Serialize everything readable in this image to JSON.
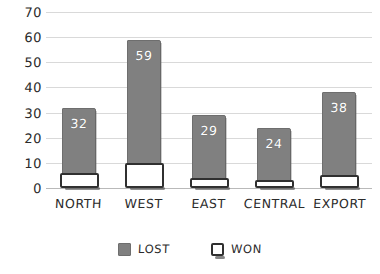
{
  "chart_data": {
    "type": "bar",
    "title": "",
    "subtitle": "",
    "xlabel": "",
    "ylabel": "",
    "categories": [
      "NORTH",
      "WEST",
      "EAST",
      "CENTRAL",
      "EXPORT"
    ],
    "series": [
      {
        "name": "LOST",
        "color": "#808080",
        "values": [
          32,
          59,
          29,
          24,
          38
        ],
        "labels": [
          "32",
          "59",
          "29",
          "24",
          "38"
        ]
      },
      {
        "name": "WON",
        "color": "#ffffff",
        "values": [
          6,
          10,
          4,
          3,
          5
        ],
        "labels": [
          "",
          "",
          "",
          "",
          ""
        ]
      }
    ],
    "ylim": [
      0,
      70
    ],
    "yticks": [
      0,
      10,
      20,
      30,
      40,
      50,
      60,
      70
    ],
    "ytick_labels": [
      "0",
      "10",
      "20",
      "30",
      "40",
      "50",
      "60",
      "70"
    ],
    "grid": true,
    "legend_position": "bottom",
    "style": "hand-drawn"
  },
  "legend": {
    "items": [
      {
        "label": "LOST",
        "swatch": "filled-gray-square"
      },
      {
        "label": "WON",
        "swatch": "outlined-white-square"
      }
    ]
  }
}
